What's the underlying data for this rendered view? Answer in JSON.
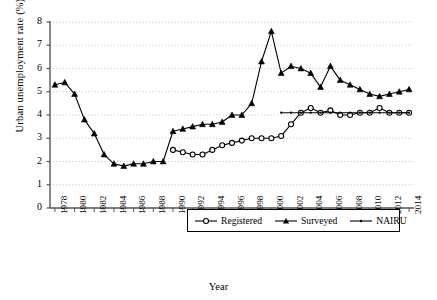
{
  "chart_data": {
    "type": "line",
    "title": "",
    "xlabel": "Year",
    "ylabel": "Urban unemployment rate (%)",
    "xlim": [
      1977.5,
      2014.5
    ],
    "ylim": [
      0,
      8
    ],
    "yticks": [
      0,
      1,
      2,
      3,
      4,
      5,
      6,
      7,
      8
    ],
    "xticks": [
      1978,
      1980,
      1982,
      1984,
      1986,
      1988,
      1990,
      1992,
      1994,
      1996,
      1998,
      2000,
      2002,
      2004,
      2006,
      2008,
      2010,
      2012,
      2014
    ],
    "grid": "horizontal-dotted",
    "legend_position": "bottom-center",
    "series": [
      {
        "name": "Registered",
        "marker": "open-circle",
        "color": "#000000",
        "x": [
          1990,
          1991,
          1992,
          1993,
          1994,
          1995,
          1996,
          1997,
          1998,
          1999,
          2000,
          2001,
          2002,
          2003,
          2004,
          2005,
          2006,
          2007,
          2008,
          2009,
          2010,
          2011,
          2012,
          2013,
          2014
        ],
        "values": [
          2.5,
          2.4,
          2.3,
          2.3,
          2.5,
          2.7,
          2.8,
          2.9,
          3.0,
          3.0,
          3.0,
          3.1,
          3.6,
          4.1,
          4.3,
          4.1,
          4.2,
          4.0,
          4.0,
          4.1,
          4.1,
          4.3,
          4.1,
          4.1,
          4.1
        ]
      },
      {
        "name": "Surveyed",
        "marker": "filled-triangle",
        "color": "#000000",
        "x": [
          1978,
          1979,
          1980,
          1981,
          1982,
          1983,
          1984,
          1985,
          1986,
          1987,
          1988,
          1989,
          1990,
          1991,
          1992,
          1993,
          1994,
          1995,
          1996,
          1997,
          1998,
          1999,
          2000,
          2001,
          2002,
          2003,
          2004,
          2005,
          2006,
          2007,
          2008,
          2009,
          2010,
          2011,
          2012,
          2013,
          2014
        ],
        "values": [
          5.3,
          5.4,
          4.9,
          3.8,
          3.2,
          2.3,
          1.9,
          1.8,
          1.9,
          1.9,
          2.0,
          2.0,
          3.3,
          3.4,
          3.5,
          3.6,
          3.6,
          3.7,
          4.0,
          4.0,
          4.5,
          6.3,
          7.6,
          5.8,
          6.1,
          6.0,
          5.8,
          5.2,
          6.1,
          5.5,
          5.3,
          5.1,
          4.9,
          4.8,
          4.9,
          5.0,
          5.1
        ]
      },
      {
        "name": "NAIRU",
        "marker": "small-dot",
        "color": "#000000",
        "x": [
          2001,
          2002,
          2003,
          2004,
          2005,
          2006,
          2007,
          2008,
          2009,
          2010,
          2011,
          2012,
          2013,
          2014
        ],
        "values": [
          4.1,
          4.1,
          4.1,
          4.1,
          4.1,
          4.1,
          4.1,
          4.1,
          4.1,
          4.1,
          4.1,
          4.1,
          4.1,
          4.1
        ]
      }
    ],
    "legend": [
      {
        "label": "Registered",
        "marker": "open-circle"
      },
      {
        "label": "Surveyed",
        "marker": "filled-triangle"
      },
      {
        "label": "NAIRU",
        "marker": "small-dot"
      }
    ]
  }
}
